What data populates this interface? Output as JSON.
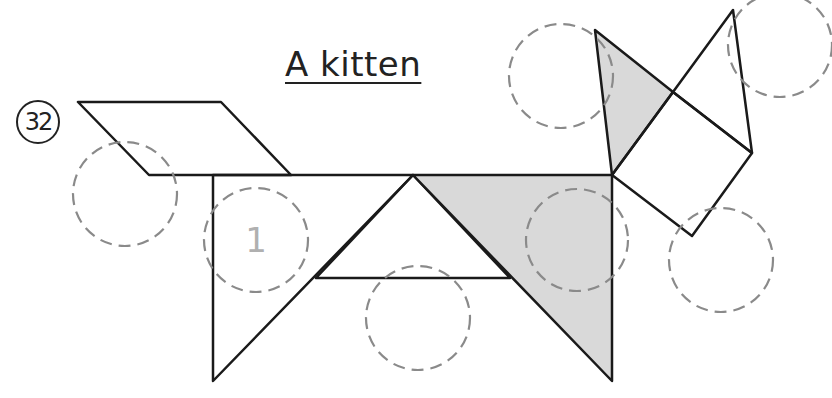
{
  "title": "A kitten",
  "puzzle_number": "32",
  "colors": {
    "outline": "#1a1a1a",
    "shaded_fill": "#d9d9d9",
    "piece_fill": "#ffffff",
    "slot_dash": "#8a8a8a",
    "hint_number": "#b0b0b0"
  },
  "pieces": [
    {
      "name": "parallelogram-tail",
      "shaded": false,
      "points": "78,102 221,102 291,175 149,175"
    },
    {
      "name": "left-leg-triangle",
      "shaded": false,
      "points": "213,175 413,175 213,381"
    },
    {
      "name": "belly-triangle",
      "shaded": false,
      "points": "413,175 316,278 510,278"
    },
    {
      "name": "right-leg-triangle",
      "shaded": true,
      "points": "413,175 612,175 612,381"
    },
    {
      "name": "left-ear-triangle",
      "shaded": true,
      "points": "595,30 673,92 612,175"
    },
    {
      "name": "face-square",
      "shaded": false,
      "points": "612,175 673,92 752,153 692,236"
    },
    {
      "name": "right-ear-triangle",
      "shaded": false,
      "points": "673,92 733,10 752,153"
    }
  ],
  "slots": [
    {
      "cx": 125,
      "cy": 194,
      "r": 52,
      "label": ""
    },
    {
      "cx": 256,
      "cy": 240,
      "r": 52,
      "label": "1"
    },
    {
      "cx": 418,
      "cy": 318,
      "r": 52,
      "label": ""
    },
    {
      "cx": 577,
      "cy": 240,
      "r": 51,
      "label": ""
    },
    {
      "cx": 561,
      "cy": 76,
      "r": 52,
      "label": ""
    },
    {
      "cx": 780,
      "cy": 45,
      "r": 52,
      "label": ""
    },
    {
      "cx": 721,
      "cy": 260,
      "r": 52,
      "label": ""
    }
  ]
}
